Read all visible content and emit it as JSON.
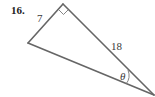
{
  "problem": {
    "number": "16."
  },
  "triangle": {
    "vertices": {
      "right_angle": [
        63,
        4
      ],
      "left": [
        28,
        43
      ],
      "bottom_right": [
        155,
        96
      ]
    },
    "sides": {
      "short_leg": "7",
      "long_leg": "18"
    },
    "angle_label": "θ",
    "right_angle_marker": true,
    "colors": {
      "stroke": "#666666",
      "text": "#3a3a3a"
    }
  }
}
